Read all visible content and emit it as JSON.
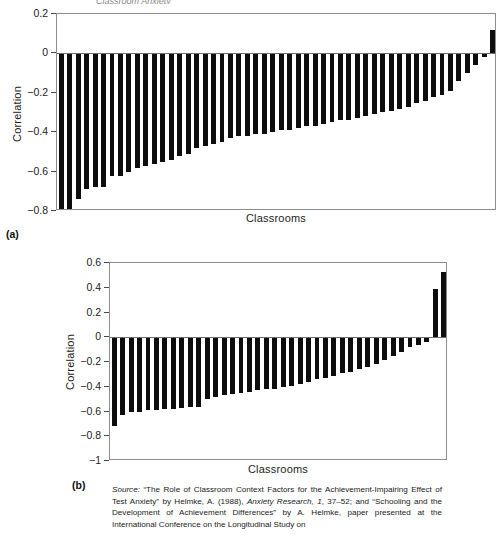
{
  "figure": {
    "clipped_header": "Classroom Anxiety",
    "panel_a_label": "(a)",
    "panel_b_label": "(b)"
  },
  "source": {
    "label": "Source:",
    "text_1": " “The Role of Classroom Context Factors for the Achievement-Impairing Effect of Test Anxiety” by Helmke, A. (1988), ",
    "journal": "Anxiety Research, 1",
    "text_2": ", 37–52; and “Schooling and the Development of Achievement Differences” by A. Helmke, paper presented at the International Conference on the Longitudinal Study on"
  },
  "chart_data": [
    {
      "type": "bar",
      "panel": "(a)",
      "title": "",
      "xlabel": "Classrooms",
      "ylabel": "Correlation",
      "ylim": [
        -0.8,
        0.2
      ],
      "yticks": [
        0.2,
        0,
        -0.2,
        -0.4,
        -0.6,
        -0.8
      ],
      "ytick_labels": [
        "0.2",
        "0",
        "−0.2",
        "−0.4",
        "−0.6",
        "−0.8"
      ],
      "grid": false,
      "legend": "none",
      "categories": [
        "1",
        "2",
        "3",
        "4",
        "5",
        "6",
        "7",
        "8",
        "9",
        "10",
        "11",
        "12",
        "13",
        "14",
        "15",
        "16",
        "17",
        "18",
        "19",
        "20",
        "21",
        "22",
        "23",
        "24",
        "25",
        "26",
        "27",
        "28",
        "29",
        "30",
        "31",
        "32",
        "33",
        "34",
        "35",
        "36",
        "37",
        "38",
        "39",
        "40",
        "41",
        "42",
        "43",
        "44",
        "45",
        "46",
        "47",
        "48",
        "49",
        "50",
        "51",
        "52"
      ],
      "values": [
        -0.8,
        -0.79,
        -0.74,
        -0.69,
        -0.68,
        -0.68,
        -0.62,
        -0.62,
        -0.6,
        -0.58,
        -0.57,
        -0.56,
        -0.55,
        -0.54,
        -0.52,
        -0.51,
        -0.48,
        -0.47,
        -0.46,
        -0.45,
        -0.43,
        -0.42,
        -0.42,
        -0.41,
        -0.41,
        -0.4,
        -0.39,
        -0.39,
        -0.38,
        -0.37,
        -0.37,
        -0.36,
        -0.35,
        -0.34,
        -0.34,
        -0.33,
        -0.32,
        -0.31,
        -0.3,
        -0.29,
        -0.28,
        -0.27,
        -0.25,
        -0.24,
        -0.22,
        -0.21,
        -0.19,
        -0.14,
        -0.1,
        -0.06,
        -0.02,
        0.12
      ]
    },
    {
      "type": "bar",
      "panel": "(b)",
      "title": "",
      "xlabel": "Classrooms",
      "ylabel": "Correlation",
      "ylim": [
        -1.0,
        0.6
      ],
      "yticks": [
        0.6,
        0.4,
        0.2,
        0,
        -0.2,
        -0.4,
        -0.6,
        -0.8,
        -1
      ],
      "ytick_labels": [
        "0.6",
        "0.4",
        "0.2",
        "0",
        "−0.2",
        "−0.4",
        "−0.6",
        "−0.8",
        "−1"
      ],
      "grid": false,
      "legend": "none",
      "categories": [
        "1",
        "2",
        "3",
        "4",
        "5",
        "6",
        "7",
        "8",
        "9",
        "10",
        "11",
        "12",
        "13",
        "14",
        "15",
        "16",
        "17",
        "18",
        "19",
        "20",
        "21",
        "22",
        "23",
        "24",
        "25",
        "26",
        "27",
        "28",
        "29",
        "30",
        "31",
        "32",
        "33",
        "34",
        "35",
        "36",
        "37",
        "38",
        "39",
        "40"
      ],
      "values": [
        -0.72,
        -0.63,
        -0.6,
        -0.6,
        -0.59,
        -0.59,
        -0.58,
        -0.58,
        -0.57,
        -0.56,
        -0.56,
        -0.5,
        -0.48,
        -0.47,
        -0.46,
        -0.45,
        -0.44,
        -0.43,
        -0.42,
        -0.42,
        -0.4,
        -0.39,
        -0.38,
        -0.36,
        -0.34,
        -0.33,
        -0.31,
        -0.29,
        -0.28,
        -0.26,
        -0.24,
        -0.22,
        -0.18,
        -0.15,
        -0.12,
        -0.08,
        -0.06,
        -0.04,
        0.39,
        0.53
      ]
    }
  ]
}
